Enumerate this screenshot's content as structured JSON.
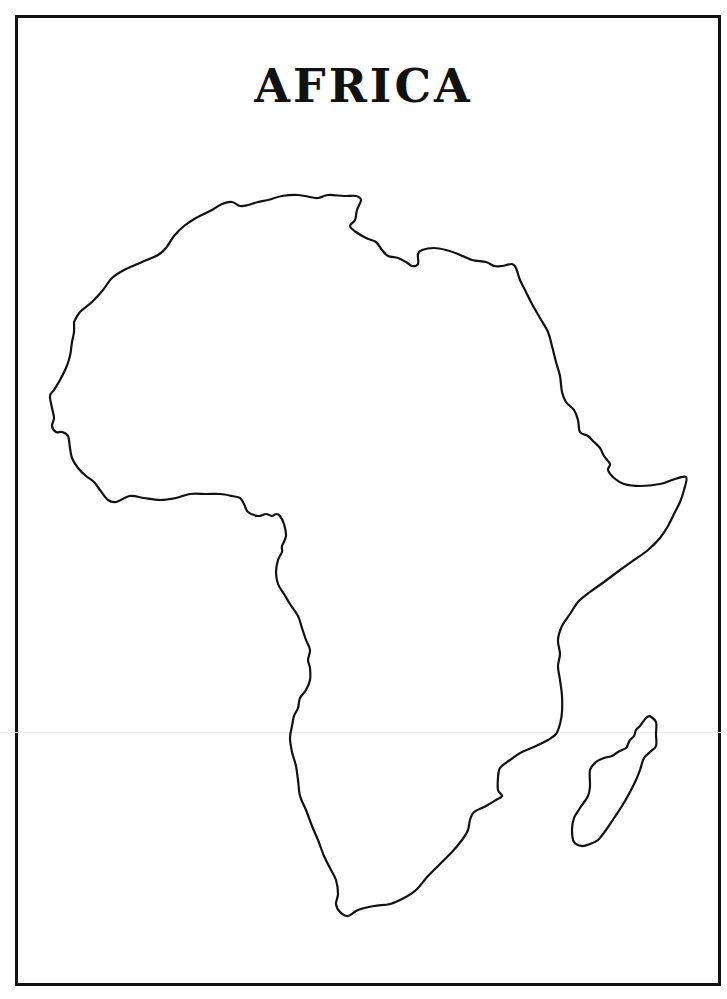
{
  "page": {
    "title": "AFRICA",
    "border_color": "#111111",
    "outline_color": "#111111",
    "background": "#ffffff"
  },
  "map": {
    "regions": [
      {
        "name": "Africa mainland",
        "points": [
          [
            74,
            322
          ],
          [
            80,
            312
          ],
          [
            92,
            302
          ],
          [
            103,
            290
          ],
          [
            112,
            278
          ],
          [
            126,
            269
          ],
          [
            142,
            262
          ],
          [
            158,
            255
          ],
          [
            166,
            248
          ],
          [
            174,
            236
          ],
          [
            184,
            226
          ],
          [
            196,
            218
          ],
          [
            212,
            210
          ],
          [
            222,
            204
          ],
          [
            232,
            202
          ],
          [
            240,
            206
          ],
          [
            248,
            205
          ],
          [
            258,
            202
          ],
          [
            268,
            200
          ],
          [
            282,
            196
          ],
          [
            298,
            195
          ],
          [
            310,
            197
          ],
          [
            318,
            198
          ],
          [
            328,
            195
          ],
          [
            344,
            196
          ],
          [
            356,
            196
          ],
          [
            361,
            200
          ],
          [
            357,
            210
          ],
          [
            355,
            220
          ],
          [
            350,
            226
          ],
          [
            356,
            232
          ],
          [
            366,
            238
          ],
          [
            376,
            242
          ],
          [
            382,
            250
          ],
          [
            388,
            256
          ],
          [
            398,
            258
          ],
          [
            406,
            262
          ],
          [
            412,
            266
          ],
          [
            418,
            264
          ],
          [
            418,
            254
          ],
          [
            422,
            250
          ],
          [
            434,
            248
          ],
          [
            446,
            250
          ],
          [
            458,
            254
          ],
          [
            472,
            260
          ],
          [
            486,
            262
          ],
          [
            494,
            266
          ],
          [
            502,
            266
          ],
          [
            512,
            264
          ],
          [
            516,
            268
          ],
          [
            520,
            280
          ],
          [
            526,
            292
          ],
          [
            532,
            304
          ],
          [
            540,
            318
          ],
          [
            548,
            332
          ],
          [
            552,
            346
          ],
          [
            556,
            362
          ],
          [
            560,
            376
          ],
          [
            562,
            392
          ],
          [
            566,
            402
          ],
          [
            574,
            410
          ],
          [
            578,
            420
          ],
          [
            580,
            432
          ],
          [
            588,
            436
          ],
          [
            594,
            442
          ],
          [
            600,
            448
          ],
          [
            604,
            456
          ],
          [
            610,
            464
          ],
          [
            608,
            470
          ],
          [
            614,
            478
          ],
          [
            624,
            484
          ],
          [
            640,
            486
          ],
          [
            660,
            484
          ],
          [
            672,
            480
          ],
          [
            686,
            477
          ],
          [
            684,
            490
          ],
          [
            680,
            502
          ],
          [
            674,
            514
          ],
          [
            668,
            526
          ],
          [
            660,
            538
          ],
          [
            648,
            550
          ],
          [
            634,
            560
          ],
          [
            620,
            570
          ],
          [
            604,
            582
          ],
          [
            590,
            592
          ],
          [
            578,
            602
          ],
          [
            570,
            614
          ],
          [
            562,
            626
          ],
          [
            558,
            640
          ],
          [
            560,
            654
          ],
          [
            558,
            666
          ],
          [
            560,
            680
          ],
          [
            562,
            696
          ],
          [
            562,
            712
          ],
          [
            560,
            724
          ],
          [
            556,
            734
          ],
          [
            548,
            740
          ],
          [
            536,
            746
          ],
          [
            522,
            752
          ],
          [
            510,
            760
          ],
          [
            500,
            768
          ],
          [
            498,
            778
          ],
          [
            498,
            790
          ],
          [
            502,
            796
          ],
          [
            496,
            800
          ],
          [
            486,
            806
          ],
          [
            474,
            812
          ],
          [
            470,
            820
          ],
          [
            468,
            830
          ],
          [
            462,
            840
          ],
          [
            452,
            852
          ],
          [
            440,
            864
          ],
          [
            428,
            876
          ],
          [
            416,
            890
          ],
          [
            404,
            898
          ],
          [
            390,
            904
          ],
          [
            374,
            906
          ],
          [
            358,
            910
          ],
          [
            348,
            916
          ],
          [
            340,
            912
          ],
          [
            336,
            904
          ],
          [
            338,
            894
          ],
          [
            336,
            880
          ],
          [
            330,
            868
          ],
          [
            324,
            856
          ],
          [
            318,
            840
          ],
          [
            312,
            826
          ],
          [
            306,
            810
          ],
          [
            300,
            796
          ],
          [
            298,
            780
          ],
          [
            296,
            766
          ],
          [
            292,
            752
          ],
          [
            290,
            738
          ],
          [
            292,
            726
          ],
          [
            294,
            716
          ],
          [
            298,
            708
          ],
          [
            300,
            698
          ],
          [
            306,
            690
          ],
          [
            310,
            680
          ],
          [
            310,
            668
          ],
          [
            308,
            660
          ],
          [
            310,
            650
          ],
          [
            306,
            640
          ],
          [
            302,
            628
          ],
          [
            298,
            616
          ],
          [
            290,
            604
          ],
          [
            284,
            594
          ],
          [
            278,
            584
          ],
          [
            276,
            572
          ],
          [
            278,
            560
          ],
          [
            282,
            552
          ],
          [
            282,
            546
          ],
          [
            286,
            536
          ],
          [
            284,
            524
          ],
          [
            280,
            516
          ],
          [
            276,
            514
          ],
          [
            272,
            516
          ],
          [
            266,
            514
          ],
          [
            258,
            516
          ],
          [
            248,
            512
          ],
          [
            244,
            504
          ],
          [
            240,
            498
          ],
          [
            232,
            496
          ],
          [
            220,
            494
          ],
          [
            206,
            494
          ],
          [
            190,
            494
          ],
          [
            176,
            498
          ],
          [
            160,
            500
          ],
          [
            144,
            498
          ],
          [
            130,
            496
          ],
          [
            116,
            502
          ],
          [
            108,
            500
          ],
          [
            100,
            490
          ],
          [
            94,
            482
          ],
          [
            86,
            476
          ],
          [
            78,
            468
          ],
          [
            72,
            458
          ],
          [
            70,
            448
          ],
          [
            68,
            436
          ],
          [
            62,
            432
          ],
          [
            56,
            432
          ],
          [
            52,
            426
          ],
          [
            54,
            418
          ],
          [
            52,
            408
          ],
          [
            50,
            396
          ],
          [
            54,
            390
          ],
          [
            60,
            380
          ],
          [
            66,
            368
          ],
          [
            70,
            356
          ],
          [
            72,
            342
          ],
          [
            74,
            332
          ],
          [
            74,
            322
          ]
        ]
      },
      {
        "name": "Madagascar",
        "points": [
          [
            650,
            716
          ],
          [
            656,
            722
          ],
          [
            656,
            734
          ],
          [
            656,
            746
          ],
          [
            650,
            752
          ],
          [
            644,
            758
          ],
          [
            640,
            770
          ],
          [
            636,
            780
          ],
          [
            630,
            792
          ],
          [
            622,
            806
          ],
          [
            614,
            818
          ],
          [
            606,
            830
          ],
          [
            598,
            840
          ],
          [
            590,
            844
          ],
          [
            582,
            846
          ],
          [
            574,
            842
          ],
          [
            572,
            830
          ],
          [
            574,
            818
          ],
          [
            580,
            808
          ],
          [
            588,
            796
          ],
          [
            590,
            786
          ],
          [
            590,
            770
          ],
          [
            596,
            762
          ],
          [
            604,
            758
          ],
          [
            612,
            756
          ],
          [
            618,
            752
          ],
          [
            626,
            748
          ],
          [
            628,
            744
          ],
          [
            630,
            740
          ],
          [
            634,
            736
          ],
          [
            636,
            730
          ],
          [
            640,
            726
          ],
          [
            646,
            718
          ],
          [
            650,
            716
          ]
        ]
      }
    ]
  }
}
